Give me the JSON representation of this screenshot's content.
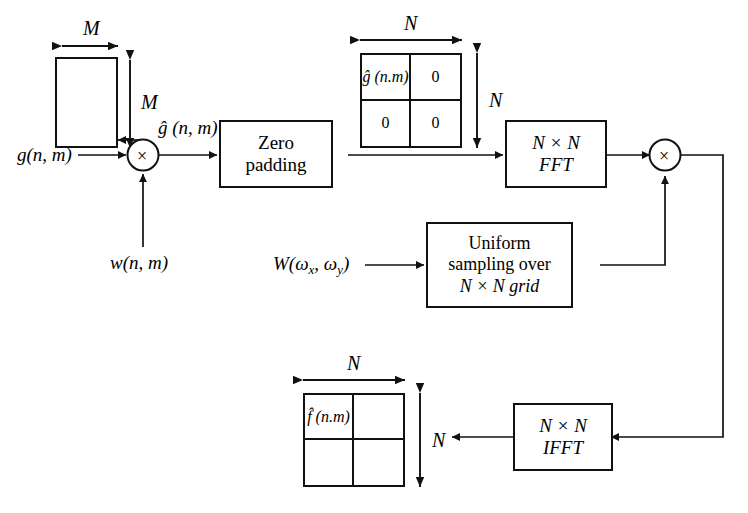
{
  "diagram": {
    "type": "signal-processing-block-diagram",
    "stroke_color": "#111111",
    "background_color": "#ffffff"
  },
  "labels": {
    "input_signal": "g(n, m)",
    "window_signal": "w(n, m)",
    "windowed_signal": "ĝ (n, m)",
    "frequency_window": "W(ω",
    "frequency_window_sub_x": "x",
    "frequency_window_mid": ", ω",
    "frequency_window_sub_y": "y",
    "frequency_window_end": ")",
    "dim_m_top": "M",
    "dim_m_right": "M",
    "dim_n_top_padded": "N",
    "dim_n_right_padded": "N",
    "dim_n_top_output": "N",
    "dim_n_right_output": "N"
  },
  "blocks": {
    "zero_padding": {
      "line1": "Zero",
      "line2": "padding"
    },
    "fft": {
      "line1": "N × N",
      "line2": "FFT"
    },
    "uniform_sampling": {
      "line1": "Uniform",
      "line2": "sampling over",
      "line3": "N × N grid"
    },
    "ifft": {
      "line1": "N × N",
      "line2": "IFFT"
    }
  },
  "multipliers": {
    "input_multiplier_symbol": "×",
    "spectral_multiplier_symbol": "×"
  },
  "padded_matrix": {
    "top_left": "ĝ (n.m)",
    "top_right": "0",
    "bottom_left": "0",
    "bottom_right": "0"
  },
  "output_matrix": {
    "top_left": "f̂ (n.m)",
    "top_right": "",
    "bottom_left": "",
    "bottom_right": ""
  }
}
